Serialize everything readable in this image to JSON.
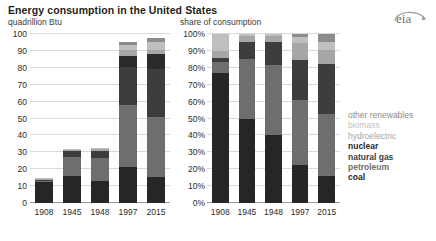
{
  "header": {
    "title": "Energy consumption in the United States",
    "subtitle_left": "quadrillion Btu",
    "subtitle_right": "share of consumption",
    "logo_text": "eia",
    "logo_name": "eia-logo"
  },
  "legend": {
    "items": [
      {
        "label": "other renewables",
        "color": "#8c8c8c",
        "bold": false
      },
      {
        "label": "biomass",
        "color": "#bfbfbf",
        "bold": false
      },
      {
        "label": "hydroelectric",
        "color": "#a6a6a6",
        "bold": false
      },
      {
        "label": "nuclear",
        "color": "#2b2b2b",
        "bold": true
      },
      {
        "label": "natural gas",
        "color": "#3d3d3d",
        "bold": true
      },
      {
        "label": "petroleum",
        "color": "#6e6e6e",
        "bold": true
      },
      {
        "label": "coal",
        "color": "#262626",
        "bold": true
      }
    ]
  },
  "chart_data": [
    {
      "id": "left",
      "type": "bar",
      "stacked": true,
      "title": "Energy consumption in the United States",
      "xlabel": "",
      "ylabel": "quadrillion Btu",
      "ylim": [
        0,
        100
      ],
      "yticks": [
        0,
        10,
        20,
        30,
        40,
        50,
        60,
        70,
        80,
        90,
        100
      ],
      "ytick_labels": [
        "0",
        "10",
        "20",
        "30",
        "40",
        "50",
        "60",
        "70",
        "80",
        "90",
        "100"
      ],
      "grid": true,
      "legend_position": "right",
      "categories": [
        "1908",
        "1945",
        "1948",
        "1997",
        "2015"
      ],
      "series": [
        {
          "name": "coal",
          "color": "#262626",
          "values": [
            12.5,
            16.0,
            13.0,
            21.5,
            15.5
          ]
        },
        {
          "name": "petroleum",
          "color": "#6e6e6e",
          "values": [
            1.0,
            11.5,
            13.5,
            36.5,
            35.5
          ]
        },
        {
          "name": "natural gas",
          "color": "#3d3d3d",
          "values": [
            0.4,
            3.0,
            4.5,
            22.5,
            28.5
          ]
        },
        {
          "name": "nuclear",
          "color": "#2b2b2b",
          "values": [
            0.0,
            0.0,
            0.0,
            6.5,
            8.5
          ]
        },
        {
          "name": "hydroelectric",
          "color": "#a6a6a6",
          "values": [
            0.6,
            1.4,
            1.4,
            3.6,
            2.4
          ]
        },
        {
          "name": "biomass",
          "color": "#bfbfbf",
          "values": [
            0.5,
            0.3,
            0.3,
            3.0,
            4.8
          ]
        },
        {
          "name": "other renewables",
          "color": "#8c8c8c",
          "values": [
            0.0,
            0.0,
            0.0,
            1.4,
            2.3
          ]
        }
      ],
      "totals": [
        15.0,
        32.2,
        32.7,
        95.0,
        97.5
      ]
    },
    {
      "id": "right",
      "type": "bar",
      "stacked": true,
      "normalized": true,
      "title": "share of consumption",
      "xlabel": "",
      "ylabel": "share of consumption",
      "ylim": [
        0,
        100
      ],
      "yticks": [
        0,
        10,
        20,
        30,
        40,
        50,
        60,
        70,
        80,
        90,
        100
      ],
      "ytick_labels": [
        "0%",
        "10%",
        "20%",
        "30%",
        "40%",
        "50%",
        "60%",
        "70%",
        "80%",
        "90%",
        "100%"
      ],
      "grid": true,
      "legend_position": "right",
      "categories": [
        "1908",
        "1945",
        "1948",
        "1997",
        "2015"
      ],
      "series": [
        {
          "name": "coal",
          "color": "#262626",
          "values": [
            77.0,
            50.0,
            40.0,
            22.5,
            16.0
          ]
        },
        {
          "name": "petroleum",
          "color": "#6e6e6e",
          "values": [
            6.5,
            35.5,
            41.5,
            38.5,
            36.5
          ]
        },
        {
          "name": "natural gas",
          "color": "#3d3d3d",
          "values": [
            2.5,
            9.5,
            13.5,
            23.5,
            29.5
          ]
        },
        {
          "name": "nuclear",
          "color": "#2b2b2b",
          "values": [
            0.0,
            0.0,
            0.0,
            0.0,
            0.0
          ]
        },
        {
          "name": "hydroelectric",
          "color": "#a6a6a6",
          "values": [
            4.0,
            4.0,
            4.0,
            10.0,
            8.5
          ]
        },
        {
          "name": "biomass",
          "color": "#bfbfbf",
          "values": [
            10.0,
            1.0,
            1.0,
            3.5,
            5.0
          ]
        },
        {
          "name": "other renewables",
          "color": "#8c8c8c",
          "values": [
            0.0,
            0.0,
            0.0,
            2.0,
            4.5
          ]
        }
      ],
      "totals": [
        100,
        100,
        100,
        100,
        100
      ]
    }
  ]
}
